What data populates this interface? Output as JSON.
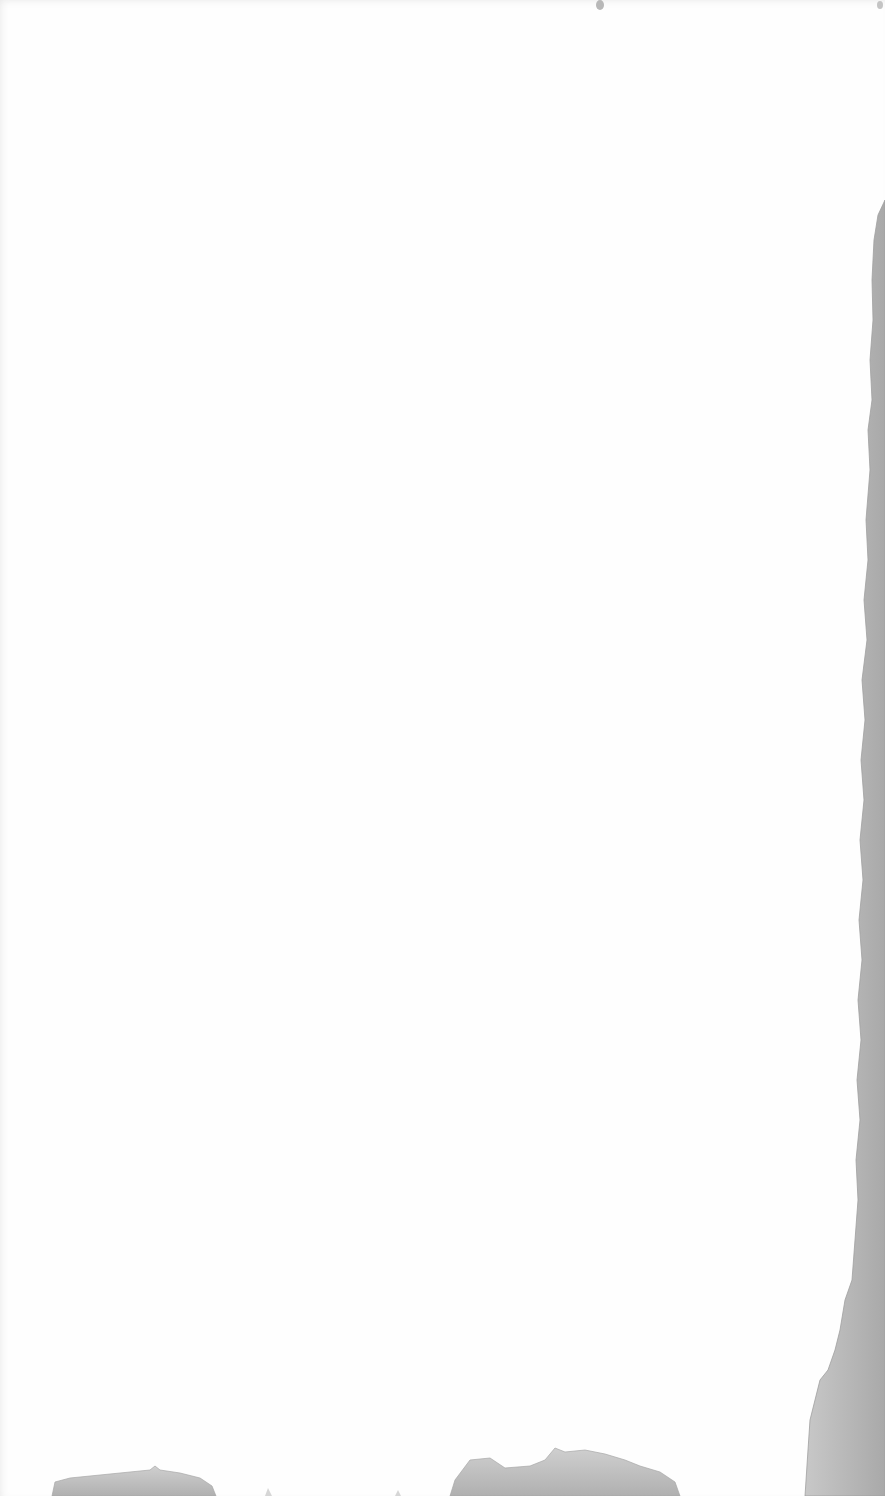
{
  "page": {
    "background_color": "#fefefe",
    "stain_color": "#b4b4b4",
    "stain_edge_color": "#9a9a9a",
    "text_content": []
  }
}
